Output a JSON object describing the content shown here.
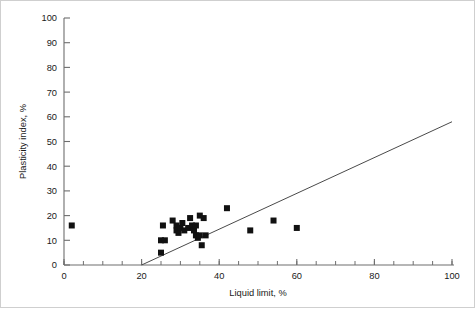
{
  "chart_data": {
    "type": "scatter",
    "title": "",
    "xlabel": "Liquid limit, %",
    "ylabel": "Plasticity index, %",
    "xlim": [
      0,
      100
    ],
    "ylim": [
      0,
      100
    ],
    "xticks": [
      0,
      20,
      40,
      60,
      80,
      100
    ],
    "xtick_labels": [
      "0",
      "20",
      "40",
      "60",
      "80",
      "100"
    ],
    "xticks_minor_step": 5,
    "yticks": [
      0,
      10,
      20,
      30,
      40,
      50,
      60,
      70,
      80,
      90,
      100
    ],
    "ytick_labels": [
      "0",
      "10",
      "20",
      "30",
      "40",
      "50",
      "60",
      "70",
      "80",
      "90",
      "100"
    ],
    "grid": false,
    "legend": null,
    "marker": "square",
    "marker_color": "#111111",
    "marker_size_px": 6,
    "points": [
      {
        "x": 2,
        "y": 16
      },
      {
        "x": 25,
        "y": 5
      },
      {
        "x": 25,
        "y": 10
      },
      {
        "x": 26,
        "y": 10
      },
      {
        "x": 25.5,
        "y": 16
      },
      {
        "x": 28,
        "y": 18
      },
      {
        "x": 29,
        "y": 16
      },
      {
        "x": 29,
        "y": 14
      },
      {
        "x": 29.5,
        "y": 13
      },
      {
        "x": 30,
        "y": 15
      },
      {
        "x": 30.5,
        "y": 17
      },
      {
        "x": 31,
        "y": 14
      },
      {
        "x": 32,
        "y": 15
      },
      {
        "x": 32.5,
        "y": 19
      },
      {
        "x": 33,
        "y": 16
      },
      {
        "x": 33.5,
        "y": 14
      },
      {
        "x": 34,
        "y": 16
      },
      {
        "x": 34,
        "y": 12
      },
      {
        "x": 34.5,
        "y": 11
      },
      {
        "x": 35,
        "y": 20
      },
      {
        "x": 35,
        "y": 12
      },
      {
        "x": 35.5,
        "y": 8
      },
      {
        "x": 36,
        "y": 19
      },
      {
        "x": 36.5,
        "y": 12
      },
      {
        "x": 42,
        "y": 23
      },
      {
        "x": 48,
        "y": 14
      },
      {
        "x": 54,
        "y": 18
      },
      {
        "x": 60,
        "y": 15
      }
    ],
    "trend_line": {
      "type": "line",
      "x_start": 20,
      "y_start": 0,
      "x_end": 100,
      "y_end": 58,
      "color": "#4a4a4a"
    }
  }
}
